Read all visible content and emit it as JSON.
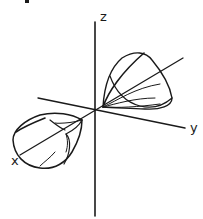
{
  "diagram": {
    "type": "3d-axes-with-orbital-lobes",
    "axes": {
      "x": {
        "label": "x"
      },
      "y": {
        "label": "y"
      },
      "z": {
        "label": "z"
      }
    },
    "lobes": [
      {
        "name": "positive-x-lobe",
        "position": "upper-right, along -x direction behind origin"
      },
      {
        "name": "negative-x-lobe",
        "position": "lower-left, along +x axis toward viewer"
      }
    ],
    "colors": {
      "line": "#1a1a1a",
      "background": "#ffffff"
    }
  }
}
